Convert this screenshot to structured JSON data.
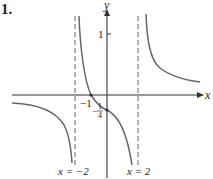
{
  "problem_number": "1.",
  "axes": {
    "x_label": "x",
    "y_label": "y",
    "y_tick_label": "1"
  },
  "asymptotes": [
    {
      "label": "x = −2",
      "value": -2
    },
    {
      "label": "x = 2",
      "value": 2
    }
  ],
  "intercepts": {
    "x_intercept_label": "−1",
    "y_intercept_numerator": "1",
    "y_intercept_denominator": "4",
    "y_intercept_sign": "−"
  },
  "colors": {
    "curve": "#666666",
    "axes": "#333333",
    "asymptote": "#666666"
  }
}
